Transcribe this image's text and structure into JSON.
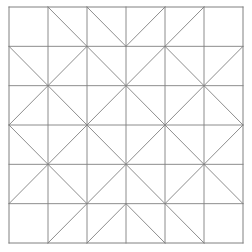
{
  "figure": {
    "name": "quilt-block-diagram",
    "title": "Geometric quilt block pattern",
    "background_color": "#ffffff",
    "line_color": "#808080",
    "border_color": "#808080",
    "line_width": 0.9,
    "border_width": 1.0
  },
  "chart_data": {
    "type": "diagram",
    "title": "Geometric quilt block pattern",
    "grid": {
      "rows": 6,
      "cols": 6,
      "show_grid_lines": true,
      "x0": 9,
      "y0": 7,
      "x1": 243,
      "y1": 243,
      "cell_width": 39,
      "cell_height": 39.33
    },
    "legend": [],
    "cell_codes": {
      "empty": "no diagonal",
      "diag": "diagonal from top-left to bottom-right",
      "anti": "diagonal from bottom-left to top-right",
      "both": "both diagonals (X)"
    },
    "cells": [
      [
        "empty",
        "diag",
        "diag",
        "anti",
        "anti",
        "empty"
      ],
      [
        "diag",
        "anti",
        "diag",
        "anti",
        "diag",
        "anti"
      ],
      [
        "anti",
        "diag",
        "anti",
        "diag",
        "anti",
        "diag"
      ],
      [
        "diag",
        "anti",
        "diag",
        "anti",
        "diag",
        "anti"
      ],
      [
        "anti",
        "diag",
        "anti",
        "diag",
        "anti",
        "diag"
      ],
      [
        "empty",
        "anti",
        "anti",
        "diag",
        "diag",
        "empty"
      ]
    ],
    "xlabel": "",
    "ylabel": "",
    "xlim": [
      0,
      6
    ],
    "ylim": [
      0,
      6
    ]
  }
}
